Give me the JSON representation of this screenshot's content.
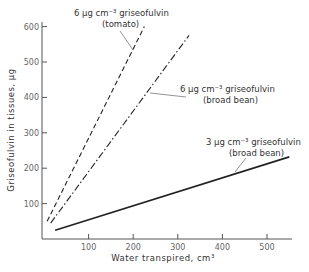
{
  "chart_data": {
    "type": "line",
    "title": "",
    "xlabel": "Water transpired, cm³",
    "ylabel": "Griseofulvin in tissues,   µg",
    "xlim": [
      0,
      550
    ],
    "ylim": [
      0,
      630
    ],
    "x_ticks": [
      100,
      200,
      300,
      400,
      500
    ],
    "y_ticks": [
      100,
      200,
      300,
      400,
      500,
      600
    ],
    "grid": false,
    "legend": "inline annotations",
    "series": [
      {
        "name": "6 µg cm⁻³ griseofulvin (tomato)",
        "label_line1": "6 µg cm⁻³ griseofulvin",
        "label_line2": "(tomato)",
        "style": "dashed",
        "x": [
          7,
          225
        ],
        "y": [
          50,
          600
        ]
      },
      {
        "name": "6 µg cm⁻³ griseofulvin (broad bean)",
        "label_line1": "6 µg cm⁻³ griseofulvin",
        "label_line2": "(broad bean)",
        "style": "dash-dot",
        "x": [
          15,
          325
        ],
        "y": [
          45,
          575
        ]
      },
      {
        "name": "3 µg cm⁻³ griseofulvin (broad bean)",
        "label_line1": "3 µg cm⁻³ griseofulvin",
        "label_line2": "(broad bean)",
        "style": "solid",
        "x": [
          25,
          550
        ],
        "y": [
          25,
          232
        ]
      }
    ]
  },
  "layout": {
    "x0_px": 44,
    "px_per_x": 0.446,
    "y0_px": 239,
    "px_per_y": 0.354
  }
}
